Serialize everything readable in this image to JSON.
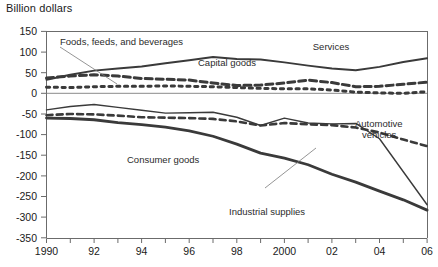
{
  "chart_data": {
    "type": "line",
    "title": "Billion dollars",
    "xlabel": "",
    "ylabel": "Billion dollars",
    "ylim": [
      -350,
      150
    ],
    "xlim": [
      1990,
      2006
    ],
    "ytick_labels": [
      "150",
      "100",
      "50",
      "0",
      "-50",
      "-100",
      "-150",
      "-200",
      "-250",
      "-300",
      "-350"
    ],
    "ytick_values": [
      150,
      100,
      50,
      0,
      -50,
      -100,
      -150,
      -200,
      -250,
      -300,
      -350
    ],
    "xtick_labels": [
      "1990",
      "92",
      "94",
      "96",
      "98",
      "2000",
      "02",
      "04",
      "06"
    ],
    "xtick_values": [
      1990,
      1992,
      1994,
      1996,
      1998,
      2000,
      2002,
      2004,
      2006
    ],
    "grid": false,
    "legend_position": "inline-annotations",
    "x": [
      1990,
      1991,
      1992,
      1993,
      1994,
      1995,
      1996,
      1997,
      1998,
      1999,
      2000,
      2001,
      2002,
      2003,
      2004,
      2005,
      2006
    ],
    "series": [
      {
        "name": "Services",
        "style": "solid-medium",
        "values": [
          33,
          45,
          55,
          60,
          65,
          73,
          80,
          88,
          83,
          82,
          75,
          67,
          60,
          56,
          64,
          76,
          85
        ]
      },
      {
        "name": "Capital goods",
        "style": "dashed-long",
        "values": [
          37,
          42,
          45,
          42,
          36,
          34,
          32,
          25,
          19,
          20,
          25,
          32,
          26,
          16,
          17,
          22,
          27
        ]
      },
      {
        "name": "Foods, feeds, and beverages",
        "style": "dotted-square",
        "values": [
          15,
          14,
          16,
          17,
          17,
          18,
          17,
          16,
          14,
          12,
          11,
          11,
          8,
          3,
          1,
          0,
          4
        ]
      },
      {
        "name": "Industrial supplies",
        "style": "solid-thin",
        "values": [
          -40,
          -32,
          -27,
          -34,
          -41,
          -48,
          -47,
          -46,
          -58,
          -78,
          -60,
          -72,
          -74,
          -73,
          -110,
          -190,
          -270
        ]
      },
      {
        "name": "Automotive vehicles",
        "style": "dashed-mid",
        "values": [
          -53,
          -50,
          -51,
          -54,
          -58,
          -59,
          -60,
          -62,
          -68,
          -78,
          -72,
          -75,
          -77,
          -83,
          -95,
          -112,
          -128
        ]
      },
      {
        "name": "Consumer goods",
        "style": "solid-thick",
        "values": [
          -60,
          -61,
          -64,
          -71,
          -76,
          -82,
          -91,
          -104,
          -123,
          -145,
          -157,
          -173,
          -196,
          -215,
          -237,
          -258,
          -283
        ]
      }
    ],
    "annotations": [
      {
        "text": "Foods, feeds, and beverages",
        "target": "Foods, feeds, and beverages"
      },
      {
        "text": "Capital goods",
        "target": "Capital goods"
      },
      {
        "text": "Services",
        "target": "Services"
      },
      {
        "text": "Automotive",
        "target": "Automotive vehicles"
      },
      {
        "text": "vehicles",
        "target": "Automotive vehicles"
      },
      {
        "text": "Consumer goods",
        "target": "Consumer goods"
      },
      {
        "text": "Industrial supplies",
        "target": "Industrial supplies"
      }
    ]
  },
  "colors": {
    "line": "#3a3a3a",
    "axis": "#6b6b6b",
    "text": "#1a1a1a",
    "background": "#ffffff"
  }
}
